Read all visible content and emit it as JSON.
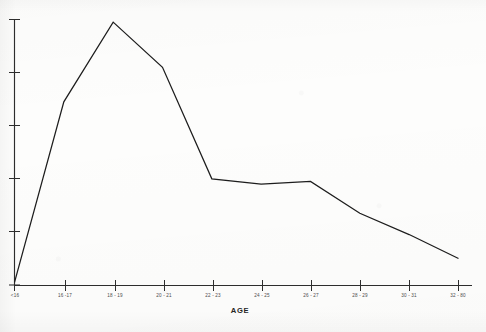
{
  "figure": {
    "width": 486,
    "height": 332,
    "background_color": "#fdfdfc",
    "ink_color": "#1d1d1d",
    "axis_color": "#2a2a2a",
    "rendering": "scanned grayscale photocopy of a printed line graph"
  },
  "chart_data": {
    "type": "line",
    "title": "",
    "subtitle": "",
    "xlabel": "AGE",
    "ylabel": "",
    "grid": false,
    "legend": null,
    "legend_position": "none",
    "categories": [
      "<16",
      "16 -17",
      "18 - 19",
      "20 - 21",
      "22 - 23",
      "24 - 25",
      "26 - 27",
      "28 - 29",
      "30 - 31",
      "32 - 80"
    ],
    "tick_labels_x": [
      "<16",
      "16 -17",
      "18 - 19",
      "20 - 21",
      "22 - 23",
      "24 - 25",
      "26 - 27",
      "28 - 29",
      "30 - 31",
      "32 - 80"
    ],
    "tick_labels_y": [
      "",
      "",
      "",
      "",
      "",
      ""
    ],
    "y_tick_count": 6,
    "ylim": [
      0,
      100
    ],
    "xlim": [
      0,
      9
    ],
    "series": [
      {
        "name": "",
        "values": [
          1,
          69,
          99,
          82,
          40,
          38,
          39,
          27,
          19,
          10
        ]
      }
    ],
    "values": [
      1,
      69,
      99,
      82,
      40,
      38,
      39,
      27,
      19,
      10
    ],
    "annotations": []
  },
  "axes": {
    "x_axis": {
      "name": "age-axis",
      "title": "AGE"
    },
    "y_axis": {
      "name": "value-axis",
      "title": ""
    }
  }
}
